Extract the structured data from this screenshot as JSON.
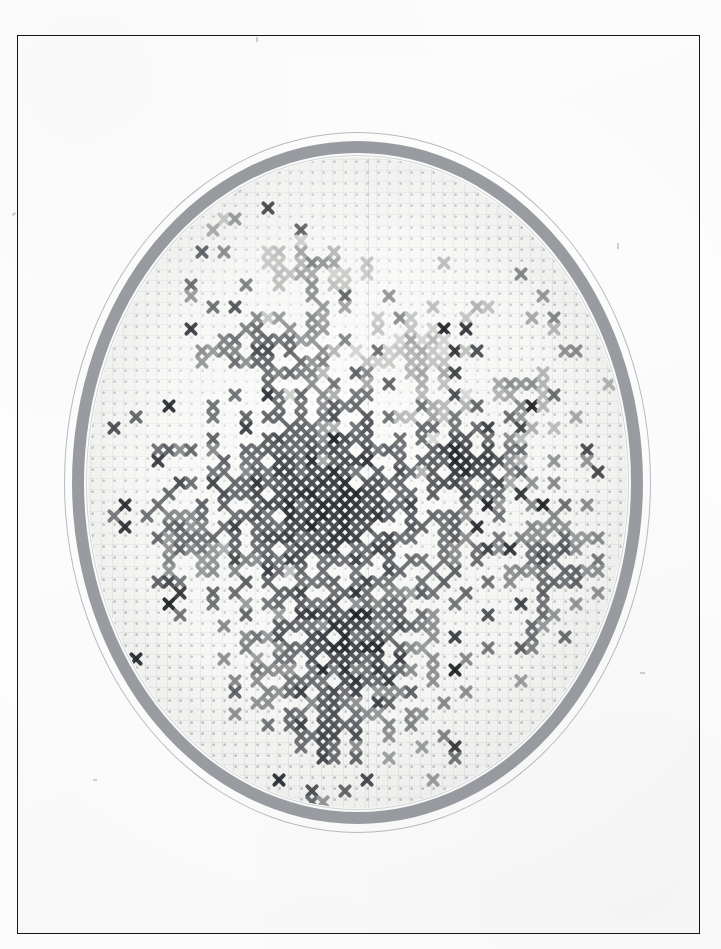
{
  "photograph": {
    "subject": "cross-stitch embroidery in oval hoop",
    "medium": "black-and-white scanned photograph",
    "frame": {
      "label": "photo-border",
      "border_color": "#14161a",
      "background_color": "#ffffff",
      "left": 17,
      "top": 35,
      "width": 683,
      "height": 899
    },
    "hoop": {
      "label": "oval embroidery hoop",
      "shape": "oval",
      "ring_color": "#9a9ea3",
      "outer_line_color": "#b9bcc0",
      "inner_line_color": "#d4d7da",
      "left": 46,
      "top": 96,
      "width": 587,
      "height": 701
    },
    "fabric": {
      "label": "aida cloth",
      "color": "#f7f7f5",
      "weave_dot_color": "#787c80",
      "weave_pitch_px": 11
    }
  },
  "chart_data": {
    "type": "heatmap",
    "xlabel": "stitch column",
    "ylabel": "stitch row",
    "grid": true,
    "legend_position": "none",
    "cell_size_px": 11,
    "columns": 48,
    "rows": 58,
    "palette": {
      "0": {
        "name": "unstitched",
        "hex": "#f7f7f5"
      },
      "1": {
        "name": "pale-highlight",
        "hex": "#c9cbc9"
      },
      "2": {
        "name": "light-gray",
        "hex": "#aeb1b0"
      },
      "3": {
        "name": "mid-gray",
        "hex": "#8d9091"
      },
      "4": {
        "name": "dark-gray",
        "hex": "#6a6d70"
      },
      "5": {
        "name": "charcoal",
        "hex": "#4a4d51"
      },
      "6": {
        "name": "near-black",
        "hex": "#313438"
      }
    },
    "motifs": [
      {
        "name": "upper-left-bloom-spike",
        "palette_keys": [
          1,
          2,
          3
        ],
        "center_col": 19,
        "center_row": 8,
        "radius": 5
      },
      {
        "name": "tall-left-stem",
        "palette_keys": [
          3,
          4,
          5
        ],
        "center_col": 15,
        "center_row": 16,
        "radius": 7
      },
      {
        "name": "central-dark-mass",
        "palette_keys": [
          4,
          5,
          6
        ],
        "center_col": 20,
        "center_row": 30,
        "radius": 12
      },
      {
        "name": "mid-right-pale-leaf",
        "palette_keys": [
          1,
          2
        ],
        "center_col": 29,
        "center_row": 16,
        "radius": 4
      },
      {
        "name": "right-upright-leaf",
        "palette_keys": [
          2,
          3
        ],
        "center_col": 38,
        "center_row": 19,
        "radius": 4
      },
      {
        "name": "right-dark-bloom",
        "palette_keys": [
          4,
          5,
          6
        ],
        "center_col": 33,
        "center_row": 26,
        "radius": 5
      },
      {
        "name": "lower-right-sprig",
        "palette_keys": [
          3,
          4,
          5
        ],
        "center_col": 41,
        "center_row": 35,
        "radius": 5
      },
      {
        "name": "bottom-foliage-sweep",
        "palette_keys": [
          3,
          4,
          5,
          6
        ],
        "center_col": 22,
        "center_row": 42,
        "radius": 11
      },
      {
        "name": "left-trailing-leaf",
        "palette_keys": [
          3,
          4
        ],
        "center_col": 8,
        "center_row": 33,
        "radius": 4
      },
      {
        "name": "bottom-tail",
        "palette_keys": [
          4,
          5
        ],
        "center_col": 19,
        "center_row": 50,
        "radius": 4
      }
    ],
    "value_counts": {
      "unstitched": 1618,
      "pale-highlight": 214,
      "light-gray": 288,
      "mid-gray": 341,
      "dark-gray": 296,
      "charcoal": 201,
      "near-black": 126
    },
    "bounding_box_stitches": {
      "col_min": 3,
      "col_max": 46,
      "row_min": 2,
      "row_max": 55
    }
  }
}
